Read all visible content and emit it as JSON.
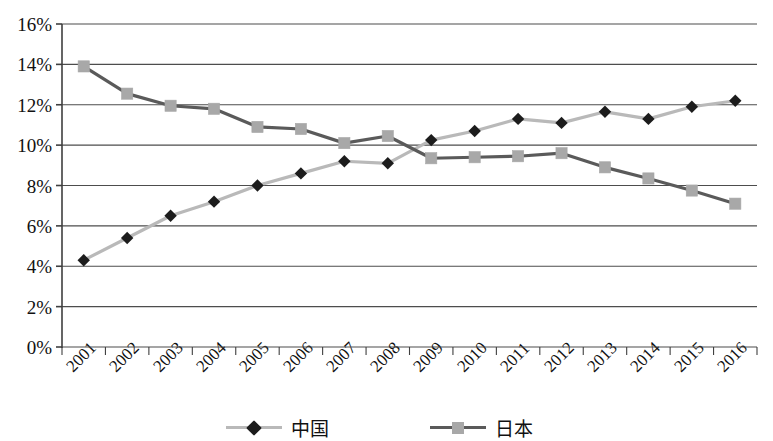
{
  "chart_data": {
    "type": "line",
    "title": "",
    "subtitle": "",
    "xlabel": "",
    "ylabel": "",
    "categories": [
      "2001",
      "2002",
      "2003",
      "2004",
      "2005",
      "2006",
      "2007",
      "2008",
      "2009",
      "2010",
      "2011",
      "2012",
      "2013",
      "2014",
      "2015",
      "2016"
    ],
    "ylim": [
      0,
      16
    ],
    "ytick_labels": [
      "16%",
      "14%",
      "12%",
      "10%",
      "8%",
      "6%",
      "4%",
      "2%",
      "0%"
    ],
    "ytick_values": [
      16,
      14,
      12,
      10,
      8,
      6,
      4,
      2,
      0
    ],
    "ytick_step": 2,
    "grid": "horizontal",
    "legend_position": "bottom",
    "series": [
      {
        "name": "中国",
        "marker": "diamond",
        "marker_color": "#1c1c1c",
        "line_color": "#b9b9b9",
        "values": [
          4.3,
          5.4,
          6.5,
          7.2,
          8.0,
          8.6,
          9.2,
          9.1,
          10.25,
          10.7,
          11.3,
          11.1,
          11.65,
          11.3,
          11.9,
          12.2
        ]
      },
      {
        "name": "日本",
        "marker": "square",
        "marker_color": "#a8a8a8",
        "line_color": "#5a5a5a",
        "values": [
          13.9,
          12.55,
          11.95,
          11.8,
          10.9,
          10.8,
          10.1,
          10.45,
          9.35,
          9.4,
          9.45,
          9.6,
          8.9,
          8.35,
          7.75,
          7.1
        ]
      }
    ]
  },
  "axis": {
    "axis_color": "#3f3f3f",
    "grid_color": "#4d4d4d"
  },
  "legend": {
    "entries": [
      {
        "label": "中国"
      },
      {
        "label": "日本"
      }
    ]
  }
}
